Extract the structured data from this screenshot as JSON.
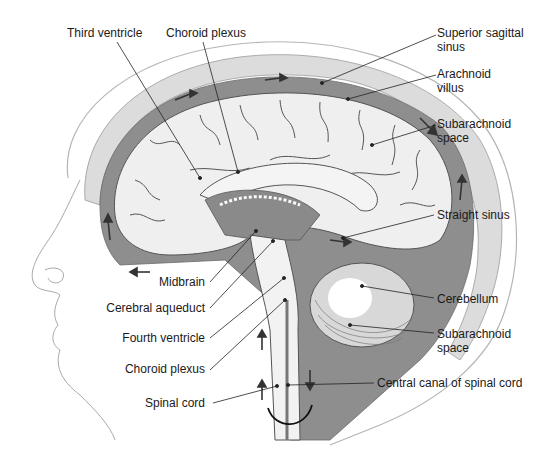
{
  "figure": {
    "colors": {
      "csf_space": "#8c8c8c",
      "brain_tissue": "#ececec",
      "bone": "#d6d6d6",
      "skin_outline": "#9a9a9a",
      "arrow": "#3a3a3a",
      "leader_line": "#222222",
      "label_text": "#1a1a1a"
    }
  },
  "labels": {
    "third_ventricle": "Third ventricle",
    "choroid_plexus_top": "Choroid plexus",
    "superior_sagittal_sinus_1": "Superior sagittal",
    "superior_sagittal_sinus_2": "sinus",
    "arachnoid_villus_1": "Arachnoid",
    "arachnoid_villus_2": "villus",
    "subarachnoid_space_top_1": "Subarachnoid",
    "subarachnoid_space_top_2": "space",
    "straight_sinus": "Straight sinus",
    "midbrain": "Midbrain",
    "cerebellum": "Cerebellum",
    "cerebral_aqueduct": "Cerebral aqueduct",
    "subarachnoid_space_bottom_1": "Subarachnoid",
    "subarachnoid_space_bottom_2": "space",
    "fourth_ventricle": "Fourth ventricle",
    "choroid_plexus_bottom": "Choroid plexus",
    "central_canal": "Central canal of spinal cord",
    "spinal_cord": "Spinal cord"
  }
}
